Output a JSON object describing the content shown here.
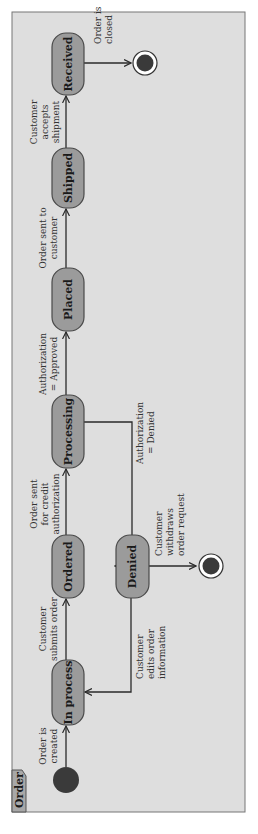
{
  "diagram": {
    "type": "uml-state-machine",
    "orientation": "rotated-90-ccw",
    "frame_title": "Order",
    "colors": {
      "frame_bg": "#dedede",
      "state_fill": "#9b9b9b",
      "state_border": "#4a4a4a",
      "node_fill": "#3a3a3a"
    },
    "states": [
      {
        "id": "in_process",
        "label": "In process"
      },
      {
        "id": "ordered",
        "label": "Ordered"
      },
      {
        "id": "processing",
        "label": "Processing"
      },
      {
        "id": "placed",
        "label": "Placed"
      },
      {
        "id": "shipped",
        "label": "Shipped"
      },
      {
        "id": "received",
        "label": "Received"
      },
      {
        "id": "denied",
        "label": "Denied"
      }
    ],
    "transitions": [
      {
        "from": "initial",
        "to": "in_process",
        "label": [
          "Order is",
          "created"
        ]
      },
      {
        "from": "in_process",
        "to": "ordered",
        "label": [
          "Customer",
          "submits order"
        ]
      },
      {
        "from": "ordered",
        "to": "processing",
        "label": [
          "Order sent",
          "for credit",
          "authorization"
        ]
      },
      {
        "from": "processing",
        "to": "placed",
        "label": [
          "Authorization",
          "= Approved"
        ]
      },
      {
        "from": "placed",
        "to": "shipped",
        "label": [
          "Order sent to",
          "customer"
        ]
      },
      {
        "from": "shipped",
        "to": "received",
        "label": [
          "Customer",
          "accepts",
          "shipment"
        ]
      },
      {
        "from": "received",
        "to": "final_1",
        "label": [
          "Order is",
          "closed"
        ]
      },
      {
        "from": "processing",
        "to": "denied",
        "label": [
          "Authorization",
          "= Denied"
        ]
      },
      {
        "from": "denied",
        "to": "in_process",
        "label": [
          "Customer",
          "edits order",
          "information"
        ]
      },
      {
        "from": "denied",
        "to": "final_2",
        "label": [
          "Customer",
          "withdraws",
          "order request"
        ]
      }
    ]
  }
}
